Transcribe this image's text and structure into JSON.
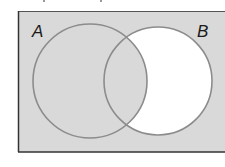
{
  "diagram": {
    "type": "venn",
    "colors": {
      "shaded": "#d9d9d9",
      "unshaded": "#ffffff",
      "circle_stroke": "#8c8c8c",
      "border": "#333333",
      "label": "#1a1a1a"
    },
    "universe": {
      "x": 18,
      "y": 11,
      "width": 215,
      "height": 141
    },
    "sets": [
      {
        "id": "A",
        "label": "A",
        "cx": 90,
        "cy": 81,
        "r": 57,
        "label_x": 32,
        "label_y": 37
      },
      {
        "id": "B",
        "label": "B",
        "cx": 158,
        "cy": 81,
        "r": 54,
        "label_x": 197,
        "label_y": 37
      }
    ],
    "shaded_regions": [
      "A only",
      "A ∩ B",
      "outside A and B"
    ],
    "unshaded_regions": [
      "B only"
    ]
  }
}
